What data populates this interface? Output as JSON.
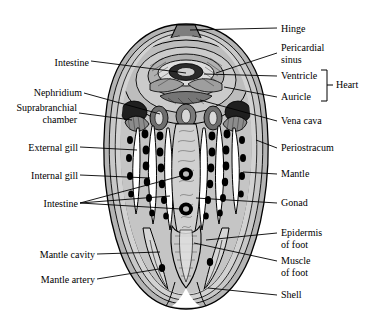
{
  "figure": {
    "background_color": "#ffffff",
    "line_color": "#000000",
    "tissue_color": "#c8c8c8",
    "shell_color": "#b4b4b4",
    "cavity_color": "#ffffff",
    "vessel_color": "#000000"
  },
  "labels_left": [
    {
      "id": "intestine-upper",
      "text": "Intestine",
      "x": 46,
      "y": 57
    },
    {
      "id": "nephridium",
      "text": "Nephridium",
      "x": 17,
      "y": 89
    },
    {
      "id": "suprabranchial-chamber",
      "text": "Suprabranchial\nchamber",
      "x": 6,
      "y": 104
    },
    {
      "id": "external-gill",
      "text": "External gill",
      "x": 22,
      "y": 143
    },
    {
      "id": "internal-gill",
      "text": "Internal gill",
      "x": 26,
      "y": 171
    },
    {
      "id": "intestine-lower",
      "text": "Intestine",
      "x": 36,
      "y": 199
    },
    {
      "id": "mantle-cavity",
      "text": "Mantle cavity",
      "x": 17,
      "y": 250
    },
    {
      "id": "mantle-artery",
      "text": "Mantle artery",
      "x": 17,
      "y": 275
    }
  ],
  "labels_right": [
    {
      "id": "hinge",
      "text": "Hinge",
      "x": 280,
      "y": 24
    },
    {
      "id": "pericardial-sinus",
      "text": "Pericardial\nsinus",
      "x": 280,
      "y": 44
    },
    {
      "id": "ventricle",
      "text": "Ventricle",
      "x": 280,
      "y": 72
    },
    {
      "id": "auricle",
      "text": "Auricle",
      "x": 280,
      "y": 93
    },
    {
      "id": "vena-cava",
      "text": "Vena cava",
      "x": 280,
      "y": 117
    },
    {
      "id": "periostracum",
      "text": "Periostracum",
      "x": 280,
      "y": 144
    },
    {
      "id": "mantle",
      "text": "Mantle",
      "x": 280,
      "y": 170
    },
    {
      "id": "gonad",
      "text": "Gonad",
      "x": 280,
      "y": 199
    },
    {
      "id": "epidermis-of-foot",
      "text": "Epidermis\nof foot",
      "x": 280,
      "y": 229
    },
    {
      "id": "muscle-of-foot",
      "text": "Muscle\nof foot",
      "x": 280,
      "y": 257
    },
    {
      "id": "shell",
      "text": "Shell",
      "x": 280,
      "y": 291
    }
  ],
  "bracket": {
    "id": "heart-bracket",
    "text": "Heart",
    "text_x": 337,
    "text_y": 81,
    "top": 70,
    "bottom": 101,
    "x": 327
  }
}
